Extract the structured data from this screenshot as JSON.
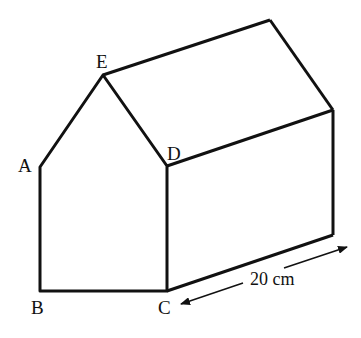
{
  "diagram": {
    "type": "prism",
    "vertices": {
      "A": {
        "label": "A",
        "x": 40,
        "y": 167
      },
      "B": {
        "label": "B",
        "x": 40,
        "y": 291
      },
      "C": {
        "label": "C",
        "x": 167,
        "y": 291
      },
      "D": {
        "label": "D",
        "x": 167,
        "y": 166
      },
      "E": {
        "label": "E",
        "x": 103,
        "y": 75
      }
    },
    "back_vertices": {
      "E2": {
        "x": 270,
        "y": 20
      },
      "D2": {
        "x": 333,
        "y": 110
      },
      "C2": {
        "x": 333,
        "y": 235
      }
    },
    "dimension": {
      "label": "20 cm",
      "value": 20,
      "unit": "cm",
      "from": "C",
      "to": "C2"
    },
    "stroke_color": "#111111",
    "background": "#ffffff"
  }
}
